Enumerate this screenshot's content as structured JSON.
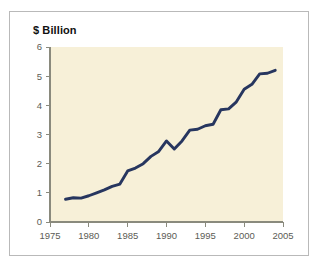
{
  "figure": {
    "background_color": "#ffffff",
    "frame_color": "#b9b9b9"
  },
  "chart_data": {
    "type": "line",
    "title": "$ Billion",
    "xlabel": "",
    "ylabel": "",
    "xlim": [
      1975,
      2005
    ],
    "ylim": [
      0,
      6
    ],
    "grid": false,
    "legend": null,
    "plot_background_color": "#f7f0d8",
    "line_color": "#27365f",
    "x_ticks": [
      "1975",
      "1980",
      "1985",
      "1990",
      "1995",
      "2000",
      "2005"
    ],
    "y_ticks": [
      "0",
      "1",
      "2",
      "3",
      "4",
      "5",
      "6"
    ],
    "x": [
      1977,
      1978,
      1979,
      1980,
      1981,
      1982,
      1983,
      1984,
      1985,
      1986,
      1987,
      1988,
      1989,
      1990,
      1991,
      1992,
      1993,
      1994,
      1995,
      1996,
      1997,
      1998,
      1999,
      2000,
      2001,
      2002,
      2003,
      2004
    ],
    "values": [
      0.78,
      0.83,
      0.82,
      0.9,
      1.0,
      1.1,
      1.22,
      1.3,
      1.75,
      1.85,
      2.0,
      2.25,
      2.42,
      2.78,
      2.5,
      2.78,
      3.15,
      3.18,
      3.3,
      3.35,
      3.85,
      3.88,
      4.12,
      4.55,
      4.72,
      5.08,
      5.1,
      5.2
    ]
  }
}
